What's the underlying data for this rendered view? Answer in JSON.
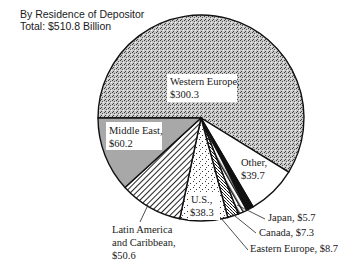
{
  "chart_data": {
    "type": "pie",
    "title": "",
    "subtitle": [
      "By Residence of Depositor",
      "Total:  $510.8 Billion"
    ],
    "total": 510.8,
    "units": "Billion $",
    "start_angle_deg": 180,
    "direction": "clockwise-over-top",
    "slices": [
      {
        "label": "Western Europe",
        "value": 300.3,
        "display": "$300.3",
        "pattern": "stipple-dense"
      },
      {
        "label": "Other",
        "value": 39.7,
        "display": "$39.7",
        "pattern": "white"
      },
      {
        "label": "Japan",
        "value": 5.7,
        "display": "$5.7",
        "pattern": "solid-black"
      },
      {
        "label": "Canada",
        "value": 7.3,
        "display": "$7.3",
        "pattern": "diagonal-stripes"
      },
      {
        "label": "Eastern Europe",
        "value": 8.7,
        "display": "$8.7",
        "pattern": "crosshatch"
      },
      {
        "label": "U.S.",
        "value": 38.3,
        "display": "$38.3",
        "pattern": "sparse-dots"
      },
      {
        "label": "Latin America and Caribbean",
        "value": 50.6,
        "display": "$50.6",
        "pattern": "diagonal-hatch"
      },
      {
        "label": "Middle East",
        "value": 60.2,
        "display": "$60.2",
        "pattern": "gray"
      }
    ]
  },
  "labels": {
    "western_europe": [
      "Western Europe,",
      "$300.3"
    ],
    "middle_east": [
      "Middle East,",
      "$60.2"
    ],
    "other": [
      "Other,",
      "$39.7"
    ],
    "us": [
      "U.S.,",
      "$38.3"
    ],
    "latin_america": [
      "Latin America",
      "and Caribbean,",
      "$50.6"
    ],
    "japan": "Japan, $5.7",
    "canada": "Canada, $7.3",
    "eastern_europe": "Eastern Europe, $8.7"
  }
}
